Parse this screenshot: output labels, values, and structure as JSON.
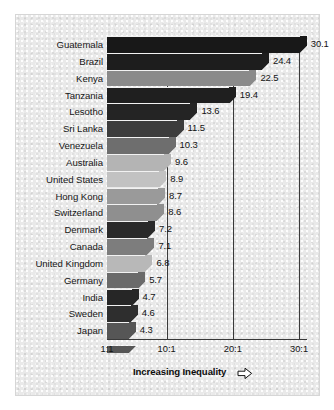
{
  "chart_data": {
    "type": "bar",
    "orientation": "horizontal",
    "title": "",
    "xlabel": "Increasing Inequality",
    "ylabel": "",
    "categories": [
      "Guatemala",
      "Brazil",
      "Kenya",
      "Tanzania",
      "Lesotho",
      "Sri Lanka",
      "Venezuela",
      "Australia",
      "United States",
      "Hong Kong",
      "Switzerland",
      "Denmark",
      "Canada",
      "United Kingdom",
      "Germany",
      "India",
      "Sweden",
      "Japan"
    ],
    "values": [
      30.1,
      24.4,
      22.5,
      19.4,
      13.6,
      11.5,
      10.3,
      9.6,
      8.9,
      8.7,
      8.6,
      7.2,
      7.1,
      6.8,
      5.7,
      4.7,
      4.6,
      4.3
    ],
    "value_labels": [
      "30.1",
      "24.4",
      "22.5",
      "19.4",
      "13.6",
      "11.5",
      "10.3",
      "9.6",
      "8.9",
      "8.7",
      "8.6",
      "7.2",
      "7.1",
      "6.8",
      "5.7",
      "4.7",
      "4.6",
      "4.3"
    ],
    "bar_colors": [
      "#181818",
      "#1d1d1d",
      "#8a8a8a",
      "#1f1f1f",
      "#242424",
      "#3c3c3c",
      "#6e6e6e",
      "#b4b4b4",
      "#c2c2c2",
      "#9a9a9a",
      "#8f8f8f",
      "#2a2a2a",
      "#7d7d7d",
      "#b8b8b8",
      "#6a6a6a",
      "#262626",
      "#2e2e2e",
      "#565656"
    ],
    "xticks": [
      1,
      10,
      20,
      30
    ],
    "xtick_labels": [
      "1:1",
      "10:1",
      "20:1",
      "30:1"
    ],
    "xlim": [
      1,
      31.2
    ],
    "gridlines": [
      10,
      20,
      30
    ],
    "grid": true,
    "legend": null,
    "axis_arrow_icon": "right-arrow-outline"
  }
}
